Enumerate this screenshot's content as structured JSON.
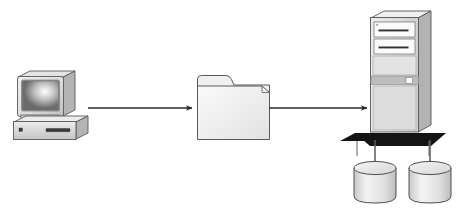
{
  "diagram": {
    "background_color": "#ffffff",
    "nodes": [
      {
        "id": "workstation",
        "data_name": "desktop-computer-icon",
        "label": "Desktop computer",
        "type": "computer",
        "position": {
          "x": 14,
          "y": 72,
          "width": 74,
          "height": 70
        },
        "colors": {
          "case_light": "#e8e8e8",
          "case_mid": "#c9c9c9",
          "case_dark": "#a8a8a8",
          "outline": "#4a4a4a",
          "screen_dark": "#6d6d6d",
          "screen_light": "#ffffff"
        },
        "parts": [
          {
            "data_name": "monitor-screen",
            "label": "Monitor screen"
          },
          {
            "data_name": "monitor-bezel",
            "label": "Monitor bezel"
          },
          {
            "data_name": "computer-base",
            "label": "Computer base unit"
          },
          {
            "data_name": "power-indicator-light",
            "label": "Power indicator"
          },
          {
            "data_name": "floppy-drive-slot",
            "label": "Floppy drive slot"
          }
        ]
      },
      {
        "id": "folder",
        "data_name": "file-folder-icon",
        "label": "File folder",
        "type": "folder",
        "position": {
          "x": 197,
          "y": 75,
          "width": 73,
          "height": 65
        },
        "colors": {
          "fill_light": "#f2f2f2",
          "fill_mid": "#e0e0e0",
          "tab_fill": "#ededed",
          "outline": "#5a5a5a"
        },
        "parts": [
          {
            "data_name": "folder-tab",
            "label": "Folder tab"
          },
          {
            "data_name": "folder-body",
            "label": "Folder body"
          }
        ]
      },
      {
        "id": "server",
        "data_name": "server-tower-icon",
        "label": "Server tower",
        "type": "server",
        "position": {
          "x": 371,
          "y": 12,
          "width": 60,
          "height": 120
        },
        "colors": {
          "front_light": "#e6e6e6",
          "front_mid": "#d2d2d2",
          "side_dark": "#b0b0b0",
          "top_light": "#f0f0f0",
          "bay_white": "#fbfbfb",
          "band_gray": "#bdbdbd",
          "slot_dark": "#3a3a3a",
          "outline": "#555555",
          "platform_black": "#151515"
        },
        "parts": [
          {
            "data_name": "server-top-face",
            "label": "Tower top face"
          },
          {
            "data_name": "drive-bay-upper",
            "label": "Upper drive bay"
          },
          {
            "data_name": "drive-bay-lower",
            "label": "Lower drive bay"
          },
          {
            "data_name": "server-control-band",
            "label": "Control panel band"
          },
          {
            "data_name": "power-button",
            "label": "Power button"
          },
          {
            "data_name": "server-platform",
            "label": "Server platform base"
          }
        ]
      },
      {
        "id": "database-left",
        "data_name": "database-cylinder-left",
        "label": "Database",
        "type": "database",
        "position": {
          "x": 354,
          "y": 160,
          "width": 42,
          "height": 46
        },
        "colors": {
          "top_fill": "#e2e2e2",
          "body_light": "#f4f4f4",
          "body_mid": "#d4d4d4",
          "outline": "#4f4f4f"
        }
      },
      {
        "id": "database-right",
        "data_name": "database-cylinder-right",
        "label": "Database",
        "type": "database",
        "position": {
          "x": 409,
          "y": 160,
          "width": 42,
          "height": 46
        },
        "colors": {
          "top_fill": "#e2e2e2",
          "body_light": "#f4f4f4",
          "body_mid": "#d4d4d4",
          "outline": "#4f4f4f"
        }
      }
    ],
    "connectors": [
      {
        "id": "arrow-computer-to-folder",
        "data_name": "arrow-computer-to-folder",
        "label": "Computer to folder",
        "from": "workstation",
        "to": "folder",
        "style": "solid-arrow",
        "color": "#2b2b2b",
        "x1": 88,
        "y1": 108,
        "x2": 196,
        "y2": 108
      },
      {
        "id": "arrow-folder-to-server",
        "data_name": "arrow-folder-to-server",
        "label": "Folder to server",
        "from": "folder",
        "to": "server",
        "style": "solid-arrow",
        "color": "#2b2b2b",
        "x1": 268,
        "y1": 108,
        "x2": 371,
        "y2": 108
      },
      {
        "id": "link-server-to-database-left",
        "data_name": "connector-server-to-database-left",
        "label": "Server to left database",
        "from": "server",
        "to": "database-left",
        "style": "plain-line",
        "color": "#5a5a5a",
        "x1": 375,
        "y1": 135,
        "x2": 375,
        "y2": 166
      },
      {
        "id": "link-server-to-database-right",
        "data_name": "connector-server-to-database-right",
        "label": "Server to right database",
        "from": "server",
        "to": "database-right",
        "style": "plain-line",
        "color": "#5a5a5a",
        "x1": 430,
        "y1": 135,
        "x2": 430,
        "y2": 166
      }
    ]
  }
}
